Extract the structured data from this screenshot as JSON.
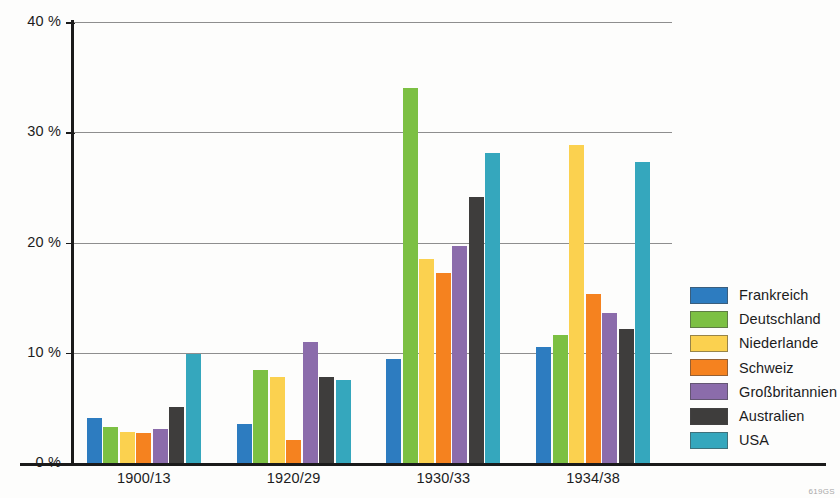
{
  "watermark": "619GS",
  "colors": {
    "frankreich": "#2d7cc0",
    "deutschland": "#7cc043",
    "niederlande": "#fbd14f",
    "schweiz": "#f5821f",
    "grossbritannien": "#8b6cab",
    "australien": "#3e3d3c",
    "usa": "#35a7bd",
    "axis": "#1a1a1a",
    "grid": "#8e8e8e"
  },
  "legend": {
    "position": "right",
    "items": [
      {
        "label": "Frankreich",
        "color_key": "frankreich"
      },
      {
        "label": "Deutschland",
        "color_key": "deutschland"
      },
      {
        "label": "Niederlande",
        "color_key": "niederlande"
      },
      {
        "label": "Schweiz",
        "color_key": "schweiz"
      },
      {
        "label": "Großbritannien",
        "color_key": "grossbritannien"
      },
      {
        "label": "Australien",
        "color_key": "australien"
      },
      {
        "label": "USA",
        "color_key": "usa"
      }
    ]
  },
  "chart_data": {
    "type": "bar",
    "title": "",
    "subtitle": "",
    "xlabel": "",
    "ylabel": "",
    "ylim": [
      0,
      40
    ],
    "yticks": [
      0,
      10,
      20,
      30,
      40
    ],
    "ytick_labels": [
      "0 %",
      "10 %",
      "20 %",
      "30 %",
      "40 %"
    ],
    "grid": true,
    "grid_axis": "y",
    "categories": [
      "1900/13",
      "1920/29",
      "1930/33",
      "1934/38"
    ],
    "series": [
      {
        "name": "Frankreich",
        "color_key": "frankreich",
        "values": [
          4.1,
          3.5,
          9.4,
          10.5
        ]
      },
      {
        "name": "Deutschland",
        "color_key": "deutschland",
        "values": [
          3.3,
          8.4,
          34.0,
          11.6
        ]
      },
      {
        "name": "Niederlande",
        "color_key": "niederlande",
        "values": [
          2.8,
          7.8,
          18.5,
          28.8
        ]
      },
      {
        "name": "Schweiz",
        "color_key": "schweiz",
        "values": [
          2.7,
          2.1,
          17.2,
          15.3
        ]
      },
      {
        "name": "Großbritannien",
        "color_key": "grossbritannien",
        "values": [
          3.1,
          11.0,
          19.7,
          13.6
        ]
      },
      {
        "name": "Australien",
        "color_key": "australien",
        "values": [
          5.1,
          7.8,
          24.1,
          12.2
        ]
      },
      {
        "name": "USA",
        "color_key": "usa",
        "values": [
          9.9,
          7.5,
          28.1,
          27.3
        ]
      }
    ]
  }
}
